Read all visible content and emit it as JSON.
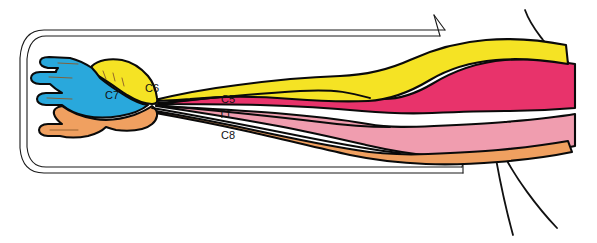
{
  "figure": {
    "background_color": "#ffffff",
    "width": 597,
    "height": 243
  },
  "palette": {
    "c5_color": "#e8336b",
    "c6_color": "#f5e324",
    "c7_color": "#29a8dc",
    "c8_color": "#f0a060",
    "t1_color": "#f09dAF",
    "outline_color": "#0a0a0a",
    "border_color": "#1a1a1a"
  },
  "labels": [
    {
      "id": "c7",
      "text": "C7",
      "x": 112,
      "y": 99,
      "color": "#111111"
    },
    {
      "id": "c6",
      "text": "C6",
      "x": 152,
      "y": 92,
      "color": "#111111"
    },
    {
      "id": "c5",
      "text": "C5",
      "x": 228,
      "y": 103,
      "color": "#111111"
    },
    {
      "id": "t1",
      "text": "T1",
      "x": 225,
      "y": 118,
      "color": "#111111"
    },
    {
      "id": "c8",
      "text": "C8",
      "x": 228,
      "y": 139,
      "color": "#111111"
    }
  ],
  "regions": [
    {
      "id": "c5",
      "name": "C5 dermatome",
      "label": "C5",
      "color": "#e8336b"
    },
    {
      "id": "c6",
      "name": "C6 dermatome",
      "label": "C6",
      "color": "#f5e324"
    },
    {
      "id": "c7",
      "name": "C7 dermatome",
      "label": "C7",
      "color": "#29a8dc"
    },
    {
      "id": "c8",
      "name": "C8 dermatome",
      "label": "C8",
      "color": "#f0a060"
    },
    {
      "id": "t1",
      "name": "T1 dermatome",
      "label": "T1",
      "color": "#f09dAF"
    }
  ]
}
